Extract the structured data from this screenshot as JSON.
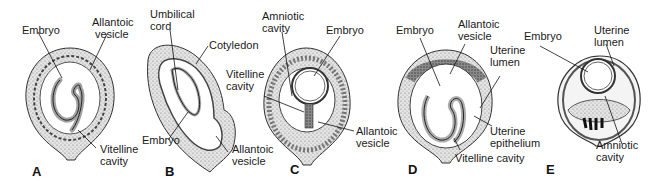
{
  "figure": {
    "panels": [
      {
        "id": "A",
        "letter": "A",
        "labels": {
          "embryo": "Embryo",
          "allantoic_vesicle_1": "Allantoic",
          "allantoic_vesicle_2": "vesicle",
          "vitelline_cavity_1": "Vitelline",
          "vitelline_cavity_2": "cavity"
        }
      },
      {
        "id": "B",
        "letter": "B",
        "labels": {
          "umbilical_cord_1": "Umbilical",
          "umbilical_cord_2": "cord",
          "cotyledon": "Cotyledon",
          "embryo": "Embryo",
          "allantoic_vesicle_1": "Allantoic",
          "allantoic_vesicle_2": "vesicle"
        }
      },
      {
        "id": "C",
        "letter": "C",
        "labels": {
          "amniotic_cavity_1": "Amniotic",
          "amniotic_cavity_2": "cavity",
          "embryo": "Embryo",
          "vitelline_cavity_1": "Vitelline",
          "vitelline_cavity_2": "cavity",
          "allantoic_vesicle_1": "Allantoic",
          "allantoic_vesicle_2": "vesicle"
        }
      },
      {
        "id": "D",
        "letter": "D",
        "labels": {
          "embryo": "Embryo",
          "allantoic_vesicle_1": "Allantoic",
          "allantoic_vesicle_2": "vesicle",
          "uterine_lumen_1": "Uterine",
          "uterine_lumen_2": "lumen",
          "uterine_epithelium_1": "Uterine",
          "uterine_epithelium_2": "epithelium",
          "vitelline_cavity": "Vitelline cavity"
        }
      },
      {
        "id": "E",
        "letter": "E",
        "labels": {
          "embryo": "Embryo",
          "uterine_lumen_1": "Uterine",
          "uterine_lumen_2": "lumen",
          "amniotic_cavity_1": "Amniotic",
          "amniotic_cavity_2": "cavity"
        }
      }
    ]
  }
}
